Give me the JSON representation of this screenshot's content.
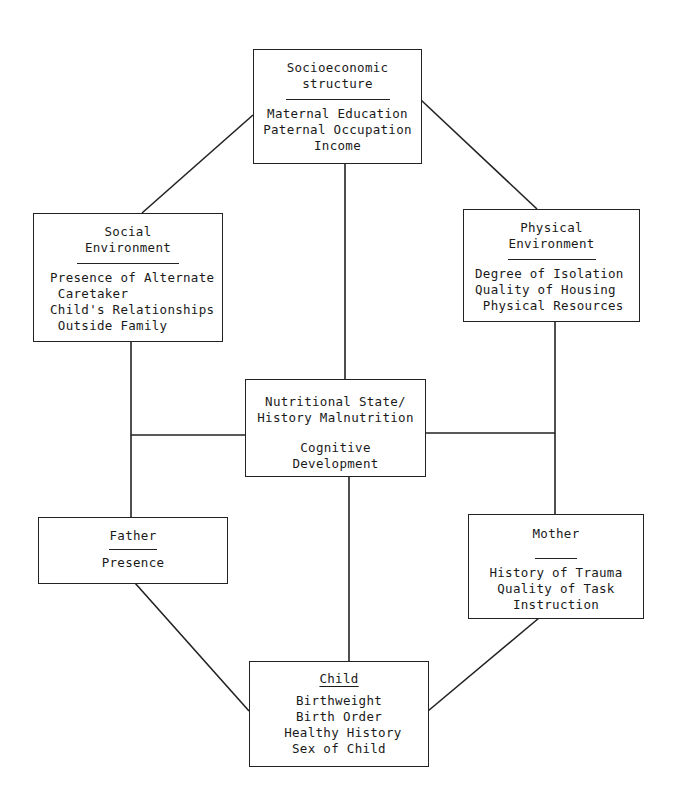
{
  "diagram": {
    "boxes": {
      "socioeconomic": {
        "title": "Socioeconomic\nstructure",
        "items": [
          "Maternal Education",
          "Paternal Occupation",
          "Income"
        ]
      },
      "social": {
        "title": "Social\nEnvironment",
        "items": [
          "Presence of Alternate",
          " Caretaker",
          "Child's Relationships",
          " Outside Family"
        ]
      },
      "physical": {
        "title": "Physical\nEnvironment",
        "items": [
          "Degree of Isolation",
          "Quality of Housing",
          " Physical Resources"
        ]
      },
      "center": {
        "line1": "Nutritional State/",
        "line2": "History Malnutrition",
        "line3": "Cognitive",
        "line4": "Development"
      },
      "father": {
        "title": "Father",
        "items": [
          "Presence"
        ]
      },
      "mother": {
        "title": "Mother",
        "items": [
          "History of Trauma",
          "Quality of Task",
          "Instruction"
        ]
      },
      "child": {
        "title": "Child",
        "items": [
          "Birthweight",
          "Birth Order",
          " Healthy History",
          "Sex of Child"
        ]
      }
    },
    "colors": {
      "line": "#222222",
      "background": "#ffffff"
    }
  }
}
